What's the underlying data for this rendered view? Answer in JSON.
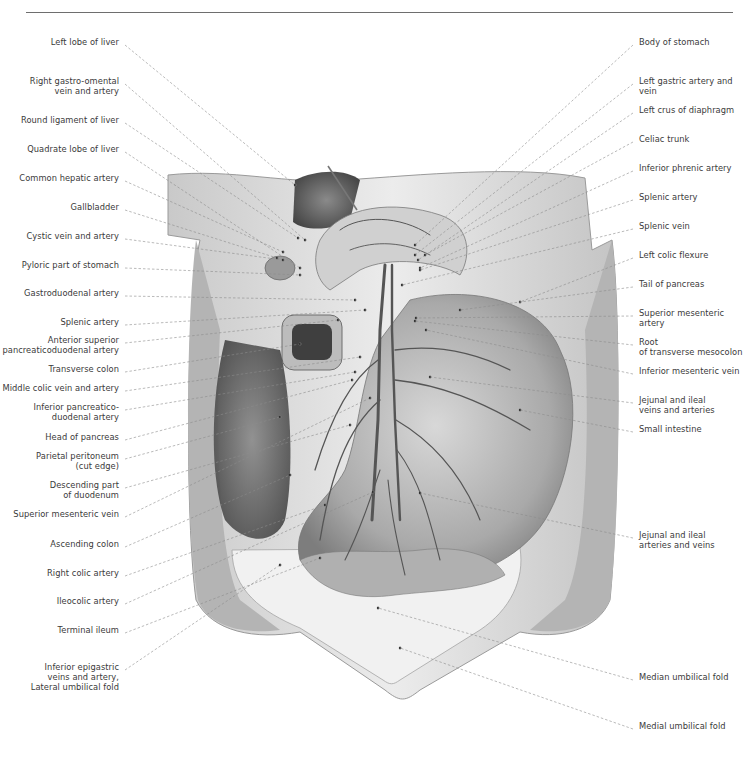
{
  "figure": {
    "left_labels": [
      {
        "text": "Left lobe of liver",
        "x": 119,
        "y": 41
      },
      {
        "text": "Right gastro-omental\nvein and artery",
        "x": 119,
        "y": 80
      },
      {
        "text": "Round ligament of liver",
        "x": 119,
        "y": 119
      },
      {
        "text": "Quadrate lobe of liver",
        "x": 119,
        "y": 148
      },
      {
        "text": "Common hepatic artery",
        "x": 119,
        "y": 177
      },
      {
        "text": "Gallbladder",
        "x": 119,
        "y": 206
      },
      {
        "text": "Cystic vein and artery",
        "x": 119,
        "y": 235
      },
      {
        "text": "Pyloric part of stomach",
        "x": 119,
        "y": 264
      },
      {
        "text": "Gastroduodenal artery",
        "x": 119,
        "y": 292
      },
      {
        "text": "Splenic artery",
        "x": 119,
        "y": 321
      },
      {
        "text": "Anterior superior\npancreaticoduodenal artery",
        "x": 119,
        "y": 339
      },
      {
        "text": "Transverse colon",
        "x": 119,
        "y": 368
      },
      {
        "text": "Middle colic vein and artery",
        "x": 119,
        "y": 387
      },
      {
        "text": "Inferior pancreatico-\nduodenal artery",
        "x": 119,
        "y": 406
      },
      {
        "text": "Head of pancreas",
        "x": 119,
        "y": 436
      },
      {
        "text": "Parietal peritoneum\n(cut edge)",
        "x": 119,
        "y": 455
      },
      {
        "text": "Descending part\nof duodenum",
        "x": 119,
        "y": 484
      },
      {
        "text": "Superior mesenteric vein",
        "x": 119,
        "y": 513
      },
      {
        "text": "Ascending colon",
        "x": 119,
        "y": 543
      },
      {
        "text": "Right colic artery",
        "x": 119,
        "y": 572
      },
      {
        "text": "Ileocolic artery",
        "x": 119,
        "y": 600
      },
      {
        "text": "Terminal ileum",
        "x": 119,
        "y": 629
      },
      {
        "text": "Inferior epigastric\nveins and artery,\nLateral umbilical fold",
        "x": 119,
        "y": 666
      }
    ],
    "right_labels": [
      {
        "text": "Body of stomach",
        "x": 639,
        "y": 41
      },
      {
        "text": "Left gastric artery and vein",
        "x": 639,
        "y": 80
      },
      {
        "text": "Left crus of diaphragm",
        "x": 639,
        "y": 109
      },
      {
        "text": "Celiac trunk",
        "x": 639,
        "y": 138
      },
      {
        "text": "Inferior phrenic artery",
        "x": 639,
        "y": 167
      },
      {
        "text": "Splenic artery",
        "x": 639,
        "y": 196
      },
      {
        "text": "Splenic vein",
        "x": 639,
        "y": 225
      },
      {
        "text": "Left colic flexure",
        "x": 639,
        "y": 254
      },
      {
        "text": "Tail of pancreas",
        "x": 639,
        "y": 283
      },
      {
        "text": "Superior mesenteric artery",
        "x": 639,
        "y": 312
      },
      {
        "text": "Root\nof transverse mesocolon",
        "x": 639,
        "y": 341
      },
      {
        "text": "Inferior mesenteric vein",
        "x": 639,
        "y": 370
      },
      {
        "text": "Jejunal and ileal\nveins and arteries",
        "x": 639,
        "y": 399
      },
      {
        "text": "Small intestine",
        "x": 639,
        "y": 428
      },
      {
        "text": "Jejunal and ileal\narteries and veins",
        "x": 639,
        "y": 534
      },
      {
        "text": "Median umbilical fold",
        "x": 639,
        "y": 676
      },
      {
        "text": "Medial umbilical fold",
        "x": 639,
        "y": 725
      }
    ],
    "left_leaders": [
      [
        125,
        45,
        295,
        185
      ],
      [
        125,
        84,
        305,
        240
      ],
      [
        125,
        123,
        298,
        238
      ],
      [
        125,
        152,
        300,
        268
      ],
      [
        125,
        181,
        283,
        252
      ],
      [
        125,
        210,
        277,
        258
      ],
      [
        125,
        239,
        283,
        260
      ],
      [
        125,
        268,
        300,
        275
      ],
      [
        125,
        296,
        355,
        300
      ],
      [
        125,
        325,
        365,
        310
      ],
      [
        125,
        343,
        338,
        320
      ],
      [
        125,
        372,
        300,
        344
      ],
      [
        125,
        391,
        360,
        357
      ],
      [
        125,
        410,
        355,
        372
      ],
      [
        125,
        440,
        352,
        380
      ],
      [
        125,
        459,
        280,
        417
      ],
      [
        125,
        488,
        350,
        425
      ],
      [
        125,
        517,
        370,
        398
      ],
      [
        125,
        547,
        290,
        475
      ],
      [
        125,
        576,
        325,
        505
      ],
      [
        125,
        604,
        373,
        492
      ],
      [
        125,
        633,
        320,
        558
      ],
      [
        125,
        670,
        280,
        565
      ]
    ],
    "right_leaders": [
      [
        633,
        45,
        415,
        245
      ],
      [
        633,
        84,
        415,
        255
      ],
      [
        633,
        113,
        418,
        260
      ],
      [
        633,
        142,
        425,
        255
      ],
      [
        633,
        171,
        420,
        268
      ],
      [
        633,
        200,
        420,
        270
      ],
      [
        633,
        229,
        402,
        285
      ],
      [
        633,
        258,
        520,
        302
      ],
      [
        633,
        287,
        460,
        310
      ],
      [
        633,
        316,
        416,
        318
      ],
      [
        633,
        345,
        415,
        321
      ],
      [
        633,
        374,
        426,
        330
      ],
      [
        633,
        403,
        430,
        377
      ],
      [
        633,
        432,
        520,
        410
      ],
      [
        633,
        538,
        420,
        493
      ],
      [
        633,
        680,
        378,
        608
      ],
      [
        633,
        729,
        400,
        648
      ]
    ]
  }
}
